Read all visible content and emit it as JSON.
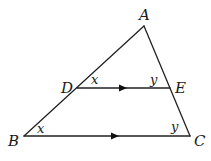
{
  "diagram": {
    "type": "triangle-with-parallel-segment",
    "points": {
      "A": {
        "label": "A",
        "x": 144,
        "y": 26
      },
      "B": {
        "label": "B",
        "x": 24,
        "y": 136
      },
      "C": {
        "label": "C",
        "x": 190,
        "y": 136
      },
      "D": {
        "label": "D",
        "x": 77,
        "y": 88
      },
      "E": {
        "label": "E",
        "x": 170,
        "y": 88
      }
    },
    "segments": [
      {
        "from": "A",
        "to": "B"
      },
      {
        "from": "A",
        "to": "C"
      },
      {
        "from": "B",
        "to": "C",
        "parallel_marker": true
      },
      {
        "from": "D",
        "to": "E",
        "parallel_marker": true
      }
    ],
    "angles": {
      "angle_ADE": {
        "label": "x"
      },
      "angle_AED": {
        "label": "y"
      },
      "angle_ABC": {
        "label": "x"
      },
      "angle_ACB": {
        "label": "y"
      }
    },
    "colors": {
      "stroke": "#222222",
      "text": "#1a1a1a",
      "background": "#ffffff"
    }
  }
}
